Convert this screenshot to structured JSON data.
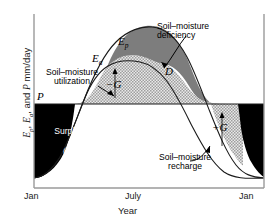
{
  "chart_data": {
    "type": "area",
    "title": "",
    "xlabel": "Year",
    "ylabel": "Ep, Ea, and P mm/day",
    "xticks": [
      "Jan",
      "July",
      "Jan"
    ],
    "grid": false,
    "legend": "none",
    "series": [
      {
        "name": "Ep",
        "label": "potential evapotranspiration",
        "x": [
          0,
          0.08,
          0.17,
          0.25,
          0.33,
          0.42,
          0.5,
          0.58,
          0.66,
          0.74,
          0.82,
          0.9,
          1.0
        ],
        "y": [
          1.0,
          1.35,
          2.1,
          3.2,
          4.35,
          5.2,
          5.5,
          5.3,
          4.6,
          3.5,
          2.3,
          1.4,
          1.0
        ]
      },
      {
        "name": "Ea",
        "label": "actual evapotranspiration",
        "x": [
          0,
          0.08,
          0.17,
          0.25,
          0.33,
          0.42,
          0.5,
          0.58,
          0.66,
          0.74,
          0.82,
          0.9,
          1.0
        ],
        "y": [
          1.0,
          1.35,
          2.1,
          2.95,
          3.5,
          3.75,
          3.6,
          3.2,
          2.75,
          2.3,
          1.85,
          1.4,
          1.0
        ]
      },
      {
        "name": "P",
        "label": "precipitation",
        "x": [
          0,
          1.0
        ],
        "y": [
          2.45,
          2.45
        ]
      }
    ],
    "regions": [
      {
        "name": "Soil-moisture deficiency",
        "symbol": "D",
        "fill": "#7d7d7d",
        "between": [
          "Ep",
          "Ea"
        ]
      },
      {
        "name": "Soil-moisture utilization",
        "symbol": "-G",
        "fill": "hatch",
        "between": [
          "Ea",
          "P"
        ],
        "side": "rising"
      },
      {
        "name": "Soil-moisture recharge",
        "symbol": "+G",
        "fill": "hatch",
        "between": [
          "Ea",
          "P"
        ],
        "side": "falling"
      },
      {
        "name": "Surplus",
        "symbol": "R",
        "fill": "#000000",
        "between": [
          "P",
          "Ea"
        ]
      }
    ],
    "colors": {
      "deficiency": "#7d7d7d",
      "surplus": "#000000",
      "hatch_fill": "#d8d8d8",
      "axis": "#808080",
      "text": "#1a1a1a"
    }
  },
  "axes": {
    "y_label_prefix": "E",
    "y_label": "Ep, Ea, and P mm/day",
    "x_label": "Year",
    "x_tick_left": "Jan",
    "x_tick_mid": "July",
    "x_tick_right": "Jan"
  },
  "labels": {
    "ep": "E",
    "ep_sub": "p",
    "ea": "E",
    "ea_sub": "a",
    "p": "P",
    "d": "D",
    "neg_g": "−G",
    "pos_g": "+G",
    "surplus": "Surplus",
    "surplus_symbol": "(R)"
  },
  "annotations": {
    "deficiency": "Soil–moisture\ndeficiency",
    "utilization": "Soil–moisture\nutilization",
    "recharge": "Soil–moisture\nrecharge"
  }
}
